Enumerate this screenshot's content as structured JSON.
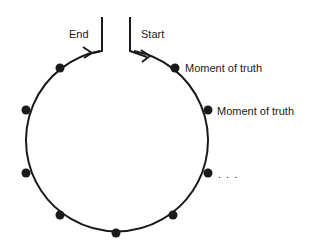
{
  "diagram": {
    "labels": {
      "end": "End",
      "start": "Start",
      "moment1": "Moment of truth",
      "moment2": "Moment of truth",
      "ellipsis": ". . ."
    },
    "colors": {
      "stroke": "#1a1a1a",
      "dot": "#1a1a1a",
      "background": "#ffffff"
    },
    "circle": {
      "cx": 117,
      "cy": 143,
      "r": 91
    },
    "dots": [
      {
        "x": 60,
        "y": 68
      },
      {
        "x": 26,
        "y": 110
      },
      {
        "x": 26,
        "y": 173
      },
      {
        "x": 60,
        "y": 215
      },
      {
        "x": 116,
        "y": 233
      },
      {
        "x": 173,
        "y": 215
      },
      {
        "x": 208,
        "y": 173
      },
      {
        "x": 208,
        "y": 110
      },
      {
        "x": 175,
        "y": 68
      }
    ]
  }
}
